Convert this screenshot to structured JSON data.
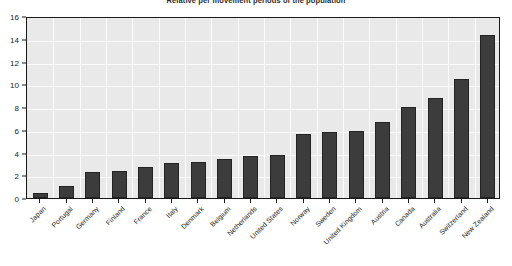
{
  "chart_data": {
    "type": "bar",
    "title": "Relative per movement periods of the population",
    "xlabel": "",
    "ylabel": "",
    "ylim": [
      0,
      16
    ],
    "ytick_values": [
      0,
      2,
      4,
      6,
      8,
      10,
      12,
      14,
      16
    ],
    "ytick_labels": [
      "0",
      "2",
      "4",
      "6",
      "8",
      "10",
      "12",
      "14",
      "16"
    ],
    "grid": true,
    "legend": false,
    "bar_color": "#3c3c3c",
    "plot_background": "#e9e9e9",
    "gridline_color": "#fbfbfb",
    "axis_color": "#1a1a1a",
    "categories": [
      "Japan",
      "Portugal",
      "Germany",
      "Finland",
      "France",
      "Italy",
      "Denmark",
      "Belgium",
      "Netherlands",
      "United States",
      "Norway",
      "Sweden",
      "United Kingdom",
      "Austria",
      "Canada",
      "Australia",
      "Switzerland",
      "New Zealand"
    ],
    "values": [
      0.4,
      1.1,
      2.3,
      2.4,
      2.7,
      3.1,
      3.2,
      3.4,
      3.7,
      3.8,
      5.6,
      5.8,
      5.9,
      6.7,
      8.0,
      8.8,
      10.5,
      14.3
    ]
  }
}
